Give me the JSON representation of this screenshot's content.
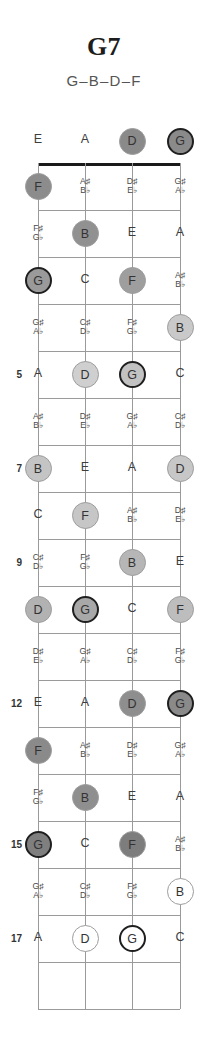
{
  "header": {
    "title": "G7",
    "subtitle": "G–B–D–F"
  },
  "instrument": {
    "strings": [
      "E",
      "A",
      "D",
      "G"
    ],
    "string_count": 4,
    "fret_count": 17
  },
  "legend": {
    "root_note": "G",
    "chord_tones": [
      "G",
      "B",
      "D",
      "F"
    ]
  },
  "chart_data": {
    "type": "diagram",
    "title": "G7",
    "subtitle": "G–B–D–F",
    "diagram_kind": "bass-fretboard-chord-map",
    "tuning": [
      "E",
      "A",
      "D",
      "G"
    ],
    "fret_markers": [
      5,
      7,
      9,
      12,
      15,
      17
    ],
    "colors": {
      "nut": "#1a1a1a",
      "fret_line": "#9a9a9a",
      "string_line": "#9a9a9a",
      "text": "#3d3d3d",
      "root_ring": "#1f1f1f"
    },
    "rows": [
      {
        "fret": 0,
        "label": "",
        "cells": [
          {
            "note": "E",
            "marked": false
          },
          {
            "note": "A",
            "marked": false
          },
          {
            "note": "D",
            "marked": true,
            "root": false,
            "shade": "#8a8a8a"
          },
          {
            "note": "G",
            "marked": true,
            "root": true,
            "shade": "#8a8a8a"
          }
        ]
      },
      {
        "fret": 1,
        "label": "",
        "cells": [
          {
            "note": "F",
            "marked": true,
            "root": false,
            "shade": "#8c8c8c"
          },
          {
            "note": "A♯\nB♭",
            "acc": true,
            "marked": false
          },
          {
            "note": "D♯\nE♭",
            "acc": true,
            "marked": false
          },
          {
            "note": "G♯\nA♭",
            "acc": true,
            "marked": false
          }
        ]
      },
      {
        "fret": 2,
        "label": "",
        "cells": [
          {
            "note": "F♯\nG♭",
            "acc": true,
            "marked": false
          },
          {
            "note": "B",
            "marked": true,
            "root": false,
            "shade": "#919191"
          },
          {
            "note": "E",
            "marked": false
          },
          {
            "note": "A",
            "marked": false
          }
        ]
      },
      {
        "fret": 3,
        "label": "",
        "cells": [
          {
            "note": "G",
            "marked": true,
            "root": true,
            "shade": "#9a9a9a"
          },
          {
            "note": "C",
            "marked": false
          },
          {
            "note": "F",
            "marked": true,
            "root": false,
            "shade": "#9e9e9e"
          },
          {
            "note": "A♯\nB♭",
            "acc": true,
            "marked": false
          }
        ]
      },
      {
        "fret": 4,
        "label": "",
        "cells": [
          {
            "note": "G♯\nA♭",
            "acc": true,
            "marked": false
          },
          {
            "note": "C♯\nD♭",
            "acc": true,
            "marked": false
          },
          {
            "note": "F♯\nG♭",
            "acc": true,
            "marked": false
          },
          {
            "note": "B",
            "marked": true,
            "root": false,
            "shade": "#c9c9c9"
          }
        ]
      },
      {
        "fret": 5,
        "label": "5",
        "cells": [
          {
            "note": "A",
            "marked": false
          },
          {
            "note": "D",
            "marked": true,
            "root": false,
            "shade": "#cfcfcf"
          },
          {
            "note": "G",
            "marked": true,
            "root": true,
            "shade": "#c2c2c2"
          },
          {
            "note": "C",
            "marked": false
          }
        ]
      },
      {
        "fret": 6,
        "label": "",
        "cells": [
          {
            "note": "A♯\nB♭",
            "acc": true,
            "marked": false
          },
          {
            "note": "D♯\nE♭",
            "acc": true,
            "marked": false
          },
          {
            "note": "G♯\nA♭",
            "acc": true,
            "marked": false
          },
          {
            "note": "C♯\nD♭",
            "acc": true,
            "marked": false
          }
        ]
      },
      {
        "fret": 7,
        "label": "7",
        "cells": [
          {
            "note": "B",
            "marked": true,
            "root": false,
            "shade": "#c4c4c4"
          },
          {
            "note": "E",
            "marked": false
          },
          {
            "note": "A",
            "marked": false
          },
          {
            "note": "D",
            "marked": true,
            "root": false,
            "shade": "#c7c7c7"
          }
        ]
      },
      {
        "fret": 8,
        "label": "",
        "cells": [
          {
            "note": "C",
            "marked": false
          },
          {
            "note": "F",
            "marked": true,
            "root": false,
            "shade": "#c6c6c6"
          },
          {
            "note": "A♯\nB♭",
            "acc": true,
            "marked": false
          },
          {
            "note": "D♯\nE♭",
            "acc": true,
            "marked": false
          }
        ]
      },
      {
        "fret": 9,
        "label": "9",
        "cells": [
          {
            "note": "C♯\nD♭",
            "acc": true,
            "marked": false
          },
          {
            "note": "F♯\nG♭",
            "acc": true,
            "marked": false
          },
          {
            "note": "B",
            "marked": true,
            "root": false,
            "shade": "#b6b6b6"
          },
          {
            "note": "E",
            "marked": false
          }
        ]
      },
      {
        "fret": 10,
        "label": "",
        "cells": [
          {
            "note": "D",
            "marked": true,
            "root": false,
            "shade": "#b2b2b2"
          },
          {
            "note": "G",
            "marked": true,
            "root": true,
            "shade": "#a8a8a8"
          },
          {
            "note": "C",
            "marked": false
          },
          {
            "note": "F",
            "marked": true,
            "root": false,
            "shade": "#bdbdbd"
          }
        ]
      },
      {
        "fret": 11,
        "label": "",
        "cells": [
          {
            "note": "D♯\nE♭",
            "acc": true,
            "marked": false
          },
          {
            "note": "G♯\nA♭",
            "acc": true,
            "marked": false
          },
          {
            "note": "C♯\nD♭",
            "acc": true,
            "marked": false
          },
          {
            "note": "F♯\nG♭",
            "acc": true,
            "marked": false
          }
        ]
      },
      {
        "fret": 12,
        "label": "12",
        "cells": [
          {
            "note": "E",
            "marked": false
          },
          {
            "note": "A",
            "marked": false
          },
          {
            "note": "D",
            "marked": true,
            "root": false,
            "shade": "#8e8e8e"
          },
          {
            "note": "G",
            "marked": true,
            "root": true,
            "shade": "#8a8a8a"
          }
        ]
      },
      {
        "fret": 13,
        "label": "",
        "cells": [
          {
            "note": "F",
            "marked": true,
            "root": false,
            "shade": "#8a8a8a"
          },
          {
            "note": "A♯\nB♭",
            "acc": true,
            "marked": false
          },
          {
            "note": "D♯\nE♭",
            "acc": true,
            "marked": false
          },
          {
            "note": "G♯\nA♭",
            "acc": true,
            "marked": false
          }
        ]
      },
      {
        "fret": 14,
        "label": "",
        "cells": [
          {
            "note": "F♯\nG♭",
            "acc": true,
            "marked": false
          },
          {
            "note": "B",
            "marked": true,
            "root": false,
            "shade": "#8f8f8f"
          },
          {
            "note": "E",
            "marked": false
          },
          {
            "note": "A",
            "marked": false
          }
        ]
      },
      {
        "fret": 15,
        "label": "15",
        "cells": [
          {
            "note": "G",
            "marked": true,
            "root": true,
            "shade": "#7f7f7f"
          },
          {
            "note": "C",
            "marked": false
          },
          {
            "note": "F",
            "marked": true,
            "root": false,
            "shade": "#7d7d7d"
          },
          {
            "note": "A♯\nB♭",
            "acc": true,
            "marked": false
          }
        ]
      },
      {
        "fret": 16,
        "label": "",
        "cells": [
          {
            "note": "G♯\nA♭",
            "acc": true,
            "marked": false
          },
          {
            "note": "C♯\nD♭",
            "acc": true,
            "marked": false
          },
          {
            "note": "F♯\nG♭",
            "acc": true,
            "marked": false
          },
          {
            "note": "B",
            "marked": true,
            "root": false,
            "shade": "#ffffff"
          }
        ]
      },
      {
        "fret": 17,
        "label": "17",
        "cells": [
          {
            "note": "A",
            "marked": false
          },
          {
            "note": "D",
            "marked": true,
            "root": false,
            "shade": "#ffffff"
          },
          {
            "note": "G",
            "marked": true,
            "root": true,
            "shade": "#ffffff"
          },
          {
            "note": "C",
            "marked": false
          }
        ]
      }
    ]
  }
}
